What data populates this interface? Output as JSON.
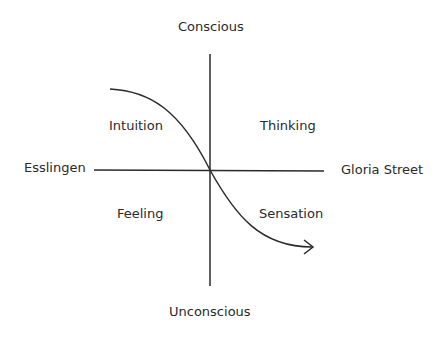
{
  "diagram": {
    "axes": {
      "top": "Conscious",
      "bottom": "Unconscious",
      "left": "Esslingen",
      "right": "Gloria Street"
    },
    "quadrants": {
      "top_left": "Intuition",
      "top_right": "Thinking",
      "bottom_left": "Feeling",
      "bottom_right": "Sensation"
    },
    "curve": {
      "description": "S-shaped arrow from upper-left (Intuition) through center to lower-right (Sensation)",
      "line_color": "#2a2a2a"
    }
  }
}
